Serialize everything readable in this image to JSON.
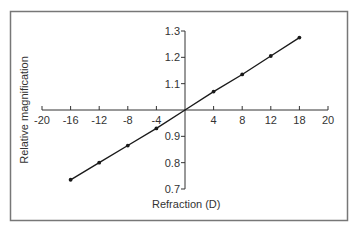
{
  "chart_data": {
    "type": "line",
    "title": "",
    "xlabel": "Refraction (D)",
    "ylabel": "Relative magnification",
    "xlim": [
      -20,
      20
    ],
    "ylim": [
      0.7,
      1.3
    ],
    "grid": false,
    "legend": null,
    "x_ticks": [
      -20,
      -16,
      -12,
      -8,
      -4,
      4,
      8,
      12,
      16,
      20
    ],
    "x_tick_labels": [
      "-20",
      "-16",
      "-12",
      "-8",
      "-4",
      "4",
      "8",
      "12",
      "18",
      "20"
    ],
    "y_ticks": [
      1.3,
      1.2,
      1.1,
      0.9,
      0.8,
      0.7
    ],
    "y_tick_labels": [
      "1.3",
      "1.2",
      "1.1",
      "0.9",
      "0.8",
      "0.7"
    ],
    "series": [
      {
        "name": "Relative magnification",
        "x": [
          -16,
          -12,
          -8,
          -4,
          0,
          4,
          8,
          12,
          16
        ],
        "y": [
          0.735,
          0.8,
          0.865,
          0.93,
          1.0,
          1.07,
          1.135,
          1.205,
          1.275
        ],
        "markers": [
          true,
          true,
          true,
          true,
          false,
          true,
          true,
          true,
          true
        ]
      }
    ]
  },
  "style": {
    "line_color": "#1a1a1a",
    "axis_color": "#333333",
    "frame_color": "#777777"
  }
}
